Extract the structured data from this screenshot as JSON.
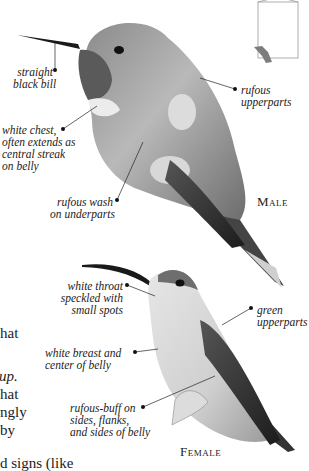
{
  "locator_map": {
    "icon": "page-locator-icon"
  },
  "male": {
    "sex_label": "Male",
    "callouts": [
      {
        "id": "bill",
        "lines": [
          "straight",
          "black bill"
        ]
      },
      {
        "id": "upperparts",
        "lines": [
          "rufous",
          "upperparts"
        ]
      },
      {
        "id": "chest",
        "lines": [
          "white chest,",
          "often extends as",
          "central streak",
          "on belly"
        ]
      },
      {
        "id": "underparts",
        "lines": [
          "rufous wash",
          "on underparts"
        ]
      }
    ]
  },
  "female": {
    "sex_label": "Female",
    "callouts": [
      {
        "id": "throat",
        "lines": [
          "white throat",
          "speckled with",
          "small spots"
        ]
      },
      {
        "id": "upperparts",
        "lines": [
          "green",
          "upperparts"
        ]
      },
      {
        "id": "breast",
        "lines": [
          "white breast and",
          "center of belly"
        ]
      },
      {
        "id": "sides",
        "lines": [
          "rufous-buff on",
          "sides, flanks,",
          "and sides of belly"
        ]
      }
    ]
  },
  "body_text_fragments": [
    "hat",
    "up.",
    "hat",
    "ngly",
    "by",
    "d signs (like"
  ]
}
